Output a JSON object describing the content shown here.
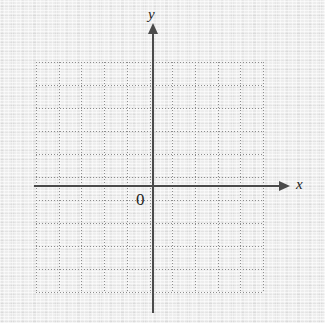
{
  "figure": {
    "type": "blank-cartesian-coordinate-grid",
    "background_color": "#e9e9e9",
    "axis_color": "#4a4a4a",
    "grid_color": "#8e8e8e"
  },
  "labels": {
    "x_axis": "x",
    "y_axis": "y",
    "origin": "0"
  },
  "chart_data": {
    "type": "scatter",
    "title": "",
    "xlabel": "x",
    "ylabel": "y",
    "x": [],
    "y": [],
    "series": [],
    "annotations": [
      "0"
    ],
    "grid": true,
    "grid_style": "dotted",
    "legend": "none",
    "origin_label": "0",
    "xlim": [
      -5,
      5
    ],
    "ylim": [
      -5,
      5
    ],
    "xticks": [
      -5,
      -4,
      -3,
      -2,
      -1,
      0,
      1,
      2,
      3,
      4,
      5
    ],
    "yticks": [
      -5,
      -4,
      -3,
      -2,
      -1,
      0,
      1,
      2,
      3,
      4,
      5
    ],
    "grid_columns": 10,
    "grid_rows": 10,
    "tick_labels_shown": false
  },
  "geometry": {
    "grid_left": 36,
    "grid_top": 62,
    "grid_right": 263,
    "grid_bottom": 292,
    "cell_width": 22.7,
    "cell_height": 23.0,
    "y_axis_x": 152,
    "x_axis_y": 185,
    "x_axis_start": 34,
    "x_axis_end": 279,
    "y_axis_top": 33,
    "y_axis_bottom": 313
  }
}
